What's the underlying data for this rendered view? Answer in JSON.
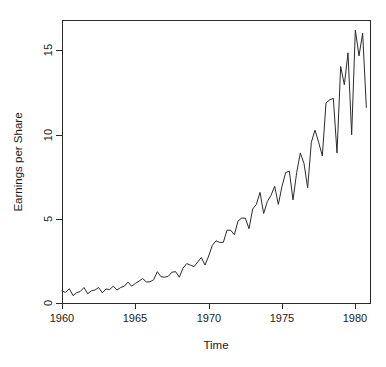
{
  "chart_data": {
    "type": "line",
    "title": "",
    "xlabel": "Time",
    "ylabel": "Earnings per Share",
    "xlim": [
      1960.0,
      1981.0
    ],
    "ylim": [
      0.0,
      16.8
    ],
    "xticks": [
      1960,
      1965,
      1970,
      1975,
      1980
    ],
    "xtick_labels": [
      "1960",
      "1965",
      "1970",
      "1975",
      "1980"
    ],
    "yticks": [
      0,
      5,
      10,
      15
    ],
    "ytick_labels": [
      "0",
      "5",
      "10",
      "15"
    ],
    "grid": false,
    "legend": null,
    "line_color": "#2b2b2b",
    "series": [
      {
        "name": "Earnings per Share",
        "x": [
          1960.0,
          1960.25,
          1960.5,
          1960.75,
          1961.0,
          1961.25,
          1961.5,
          1961.75,
          1962.0,
          1962.25,
          1962.5,
          1962.75,
          1963.0,
          1963.25,
          1963.5,
          1963.75,
          1964.0,
          1964.25,
          1964.5,
          1964.75,
          1965.0,
          1965.25,
          1965.5,
          1965.75,
          1966.0,
          1966.25,
          1966.5,
          1966.75,
          1967.0,
          1967.25,
          1967.5,
          1967.75,
          1968.0,
          1968.25,
          1968.5,
          1968.75,
          1969.0,
          1969.25,
          1969.5,
          1969.75,
          1970.0,
          1970.25,
          1970.5,
          1970.75,
          1971.0,
          1971.25,
          1971.5,
          1971.75,
          1972.0,
          1972.25,
          1972.5,
          1972.75,
          1973.0,
          1973.25,
          1973.5,
          1973.75,
          1974.0,
          1974.25,
          1974.5,
          1974.75,
          1975.0,
          1975.25,
          1975.5,
          1975.75,
          1976.0,
          1976.25,
          1976.5,
          1976.75,
          1977.0,
          1977.25,
          1977.5,
          1977.75,
          1978.0,
          1978.25,
          1978.5,
          1978.75,
          1979.0,
          1979.25,
          1979.5,
          1979.75,
          1980.0,
          1980.25,
          1980.5,
          1980.75
        ],
        "values": [
          0.71,
          0.63,
          0.85,
          0.44,
          0.61,
          0.69,
          0.92,
          0.55,
          0.72,
          0.77,
          0.92,
          0.6,
          0.83,
          0.8,
          1.0,
          0.77,
          0.92,
          1.0,
          1.24,
          1.0,
          1.16,
          1.3,
          1.45,
          1.25,
          1.26,
          1.38,
          1.86,
          1.56,
          1.53,
          1.59,
          1.83,
          1.86,
          1.53,
          2.07,
          2.34,
          2.25,
          2.16,
          2.43,
          2.7,
          2.25,
          2.79,
          3.42,
          3.69,
          3.6,
          3.6,
          4.32,
          4.32,
          4.05,
          4.86,
          5.04,
          5.04,
          4.41,
          5.58,
          5.85,
          6.57,
          5.31,
          6.03,
          6.39,
          6.93,
          5.85,
          6.93,
          7.74,
          7.83,
          6.12,
          7.74,
          8.91,
          8.28,
          6.84,
          9.54,
          10.26,
          9.54,
          8.73,
          11.88,
          12.06,
          12.15,
          8.91,
          14.04,
          12.96,
          14.85,
          9.99,
          16.2,
          14.67,
          16.02,
          11.61
        ]
      }
    ]
  },
  "geometry": {
    "plot_left": 62,
    "plot_right": 370,
    "plot_top": 20,
    "plot_bottom": 303
  }
}
